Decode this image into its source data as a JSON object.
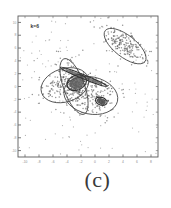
{
  "figure": {
    "caption": "(c)",
    "annotation": "k=6",
    "background": "#ffffff",
    "ink_color": "#4a4a4a"
  },
  "axes": {
    "x_ticks": [
      "-10",
      "-8",
      "-6",
      "-4",
      "-2",
      "0",
      "2",
      "4",
      "6",
      "8"
    ],
    "y_ticks": [
      "10",
      "8",
      "6",
      "4",
      "2",
      "0",
      "-2",
      "-4",
      "-6",
      "-8",
      "-10"
    ],
    "xlim": [
      -11,
      9
    ],
    "ylim": [
      -11,
      11
    ],
    "frame": {
      "left": 18,
      "top": 16,
      "right": 158,
      "bottom": 157
    },
    "grid": false,
    "tick_color": "#6b6b6b",
    "frame_color": "#5a5a5a"
  },
  "chart_data": {
    "type": "scatter",
    "title": "",
    "subtitle": "",
    "xlabel": "",
    "ylabel": "",
    "xlim": [
      -11,
      9
    ],
    "ylim": [
      -11,
      11
    ],
    "grid": false,
    "legend": "none",
    "annotations": [
      {
        "text": "k=6",
        "x": -9.2,
        "y": 9.2
      },
      {
        "text": "(c)",
        "x": 2.0,
        "y": -13.5
      }
    ],
    "components": [
      {
        "name": "cluster-upper-right",
        "mean": [
          4.3,
          6.3
        ],
        "n_points": 190,
        "ellipse": {
          "cx": 4.3,
          "cy": 6.3,
          "rx": 3.6,
          "ry": 1.7,
          "angle_deg": -38
        },
        "density": "dense",
        "fill": "none",
        "stroke": "#4a4a4a"
      },
      {
        "name": "cluster-large-left",
        "mean": [
          -4.3,
          0.2
        ],
        "n_points": 150,
        "ellipse": {
          "cx": -4.3,
          "cy": 0.2,
          "rx": 3.5,
          "ry": 2.6,
          "angle_deg": 18
        },
        "density": "sparse",
        "fill": "none",
        "stroke": "#4a4a4a"
      },
      {
        "name": "cluster-large-right",
        "mean": [
          -0.6,
          -1.4
        ],
        "n_points": 160,
        "ellipse": {
          "cx": -0.6,
          "cy": -1.4,
          "rx": 3.9,
          "ry": 2.9,
          "angle_deg": -12
        },
        "density": "sparse",
        "fill": "none",
        "stroke": "#4a4a4a"
      },
      {
        "name": "cluster-tall-narrow",
        "mean": [
          -3.0,
          0.0
        ],
        "n_points": 80,
        "ellipse": {
          "cx": -3.0,
          "cy": 0.0,
          "rx": 1.5,
          "ry": 4.6,
          "angle_deg": 20
        },
        "density": "sparse",
        "fill": "none",
        "stroke": "#4a4a4a"
      },
      {
        "name": "cluster-needle",
        "mean": [
          -1.6,
          1.5
        ],
        "n_points": 60,
        "ellipse": {
          "cx": -1.6,
          "cy": 1.5,
          "rx": 3.6,
          "ry": 0.32,
          "angle_deg": -22
        },
        "density": "very-dense",
        "fill": "#6b6b6b",
        "stroke": "#333333"
      },
      {
        "name": "cluster-teardrop",
        "mean": [
          -2.6,
          0.6
        ],
        "n_points": 120,
        "ellipse": {
          "cx": -2.6,
          "cy": 0.6,
          "rx": 1.45,
          "ry": 1.15,
          "angle_deg": 25
        },
        "density": "very-dense",
        "fill": "#636363",
        "stroke": "#2f2f2f"
      },
      {
        "name": "cluster-small-blob",
        "mean": [
          0.9,
          -2.3
        ],
        "n_points": 45,
        "ellipse": {
          "cx": 0.9,
          "cy": -2.3,
          "rx": 0.85,
          "ry": 0.6,
          "angle_deg": -18
        },
        "density": "very-dense",
        "fill": "#4f4f4f",
        "stroke": "#2a2a2a"
      }
    ],
    "background_noise": {
      "n_points": 120,
      "spread": "full-axes"
    },
    "point_color": "#555555",
    "point_size": 0.75
  }
}
